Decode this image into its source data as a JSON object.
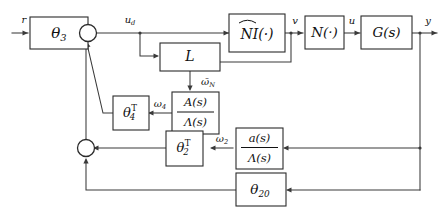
{
  "figure": {
    "kind": "control-system-block-diagram",
    "width": 443,
    "height": 216,
    "background_color": "#ffffff",
    "line_color": "#3a3a3a",
    "box_stroke_color": "#2b2b2b",
    "text_color": "#111111"
  },
  "blocks": {
    "theta3": {
      "base": "θ",
      "sub": "3",
      "sup": ""
    },
    "nihat": {
      "text": "NI(·)",
      "hat_over": "NI"
    },
    "n_nl": {
      "text": "N(·)"
    },
    "g_s": {
      "text": "G(s)"
    },
    "l_gain": {
      "text": "L"
    },
    "a_big_frac": {
      "numerator": "A(s)",
      "denominator": "Λ(s)"
    },
    "a_small_frac": {
      "numerator": "a(s)",
      "denominator": "Λ(s)"
    },
    "theta4t": {
      "base": "θ",
      "sub": "4",
      "sup": "T"
    },
    "theta2t": {
      "base": "θ",
      "sub": "2",
      "sup": "T"
    },
    "theta20": {
      "base": "θ",
      "sub": "20",
      "sup": ""
    }
  },
  "signals": {
    "r": "r",
    "u_d": {
      "base": "u",
      "sub": "d"
    },
    "v": "v",
    "u": "u",
    "y": "y",
    "omega_bar_N": {
      "base": "ω̄",
      "sub": "N"
    },
    "omega_4": {
      "base": "ω",
      "sub": "4"
    },
    "omega_2": {
      "base": "ω",
      "sub": "2"
    }
  },
  "junctions": {
    "sum_top": {
      "name": "summing-junction-top",
      "shape": "circle"
    },
    "sum_bottom": {
      "name": "summing-junction-bottom",
      "shape": "circle"
    }
  }
}
